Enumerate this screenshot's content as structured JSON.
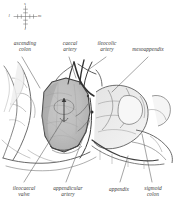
{
  "figure": {
    "kind": "anatomical-illustration",
    "background_color": "#ffffff",
    "ink_color": "#3b3b3b",
    "shade_color": "#b9b9b9"
  },
  "orientation_key": {
    "name": "compass-rose",
    "superior": "s",
    "inferior": "i",
    "lateral": "l",
    "medial": "m"
  },
  "labels": {
    "top": [
      {
        "id": "ascending-colon",
        "text": "ascending\ncolon"
      },
      {
        "id": "caecal-artery",
        "text": "caecal\nartery"
      },
      {
        "id": "ileocolic-artery",
        "text": "ileocolic\nartery"
      },
      {
        "id": "mesoappendix",
        "text": "mesoappendix"
      }
    ],
    "bottom": [
      {
        "id": "ileocaecal-valve",
        "text": "ileocaecal\nvalve"
      },
      {
        "id": "appendicular-artery",
        "text": "appendicular\nartery"
      },
      {
        "id": "appendix",
        "text": "appendix"
      },
      {
        "id": "sigmoid-colon",
        "text": "sigmoid\ncolon"
      }
    ]
  }
}
